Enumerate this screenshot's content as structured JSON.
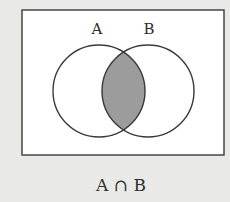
{
  "diagram": {
    "type": "venn",
    "universe": {
      "x": 22,
      "y": 10,
      "width": 202,
      "height": 145,
      "fill": "#ffffff",
      "stroke": "#3a3a3a"
    },
    "sets": [
      {
        "label": "A",
        "cx": 99,
        "cy": 91,
        "r": 46,
        "label_x": 97,
        "label_y": 34
      },
      {
        "label": "B",
        "cx": 148,
        "cy": 91,
        "r": 46,
        "label_x": 149,
        "label_y": 34
      }
    ],
    "shaded_region": "A ∩ B",
    "shade_color": "#9c9c9c",
    "stroke_color": "#3a3a3a",
    "background": "#e9e9e7",
    "caption": "A ∩ B"
  }
}
